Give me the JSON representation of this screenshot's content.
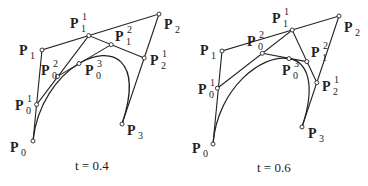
{
  "panels": [
    {
      "caption": "t = 0.4",
      "t": 0.4,
      "points": {
        "P0": [
          33,
          141
        ],
        "P1": [
          42,
          50
        ],
        "P2": [
          159,
          14
        ],
        "P3": [
          122,
          124
        ],
        "P0_1": [
          36.6,
          104.6
        ],
        "P1_1": [
          88.8,
          35.6
        ],
        "P2_1": [
          144.2,
          58
        ],
        "P0_2": [
          57.5,
          76.4
        ],
        "P1_2": [
          111.2,
          44.6
        ],
        "P0_3": [
          79,
          63.5
        ]
      },
      "labels": [
        {
          "id": "P0",
          "base": "P",
          "sub": "0",
          "sup": "",
          "x": 10,
          "y": 152
        },
        {
          "id": "P1",
          "base": "P",
          "sub": "1",
          "sup": "",
          "x": 19,
          "y": 55
        },
        {
          "id": "P2",
          "base": "P",
          "sub": "2",
          "sup": "",
          "x": 164,
          "y": 29
        },
        {
          "id": "P3",
          "base": "P",
          "sub": "3",
          "sup": "",
          "x": 127,
          "y": 135
        },
        {
          "id": "P0_1",
          "base": "P",
          "sub": "0",
          "sup": "1",
          "x": 15,
          "y": 110
        },
        {
          "id": "P1_1",
          "base": "P",
          "sub": "1",
          "sup": "1",
          "x": 70,
          "y": 28
        },
        {
          "id": "P2_1",
          "base": "P",
          "sub": "2",
          "sup": "1",
          "x": 150,
          "y": 65
        },
        {
          "id": "P0_2",
          "base": "P",
          "sub": "0",
          "sup": "2",
          "x": 41,
          "y": 75
        },
        {
          "id": "P1_2",
          "base": "P",
          "sub": "1",
          "sup": "2",
          "x": 115,
          "y": 41
        },
        {
          "id": "P0_3",
          "base": "P",
          "sub": "0",
          "sup": "3",
          "x": 85,
          "y": 75
        }
      ]
    },
    {
      "caption": "t = 0.6",
      "t": 0.6,
      "points": {
        "P0": [
          213,
          144
        ],
        "P1": [
          222,
          51
        ],
        "P2": [
          339,
          16
        ],
        "P3": [
          302,
          127
        ],
        "P0_1": [
          217.4,
          88.2
        ],
        "P1_1": [
          292.2,
          30
        ],
        "P2_1": [
          316.8,
          82.6
        ],
        "P0_2": [
          262.3,
          53.3
        ],
        "P1_2": [
          306.8,
          61.6
        ],
        "P0_3": [
          289,
          58.6
        ]
      },
      "labels": [
        {
          "id": "P0",
          "base": "P",
          "sub": "0",
          "sup": "",
          "x": 192,
          "y": 153
        },
        {
          "id": "P1",
          "base": "P",
          "sub": "1",
          "sup": "",
          "x": 200,
          "y": 55
        },
        {
          "id": "P2",
          "base": "P",
          "sub": "2",
          "sup": "",
          "x": 344,
          "y": 32
        },
        {
          "id": "P3",
          "base": "P",
          "sub": "3",
          "sup": "",
          "x": 308,
          "y": 138
        },
        {
          "id": "P0_1",
          "base": "P",
          "sub": "0",
          "sup": "1",
          "x": 198,
          "y": 94
        },
        {
          "id": "P1_1",
          "base": "P",
          "sub": "1",
          "sup": "1",
          "x": 272,
          "y": 23
        },
        {
          "id": "P2_1",
          "base": "P",
          "sub": "2",
          "sup": "1",
          "x": 322,
          "y": 91
        },
        {
          "id": "P0_2",
          "base": "P",
          "sub": "0",
          "sup": "2",
          "x": 247,
          "y": 46
        },
        {
          "id": "P1_2",
          "base": "P",
          "sub": "1",
          "sup": "2",
          "x": 311,
          "y": 57
        },
        {
          "id": "P0_3",
          "base": "P",
          "sub": "0",
          "sup": "3",
          "x": 282,
          "y": 75
        }
      ]
    }
  ],
  "captions": {
    "left": "t = 0.4",
    "right": "t = 0.6"
  },
  "colors": {
    "stroke": "#222222",
    "background": "#ffffff"
  }
}
